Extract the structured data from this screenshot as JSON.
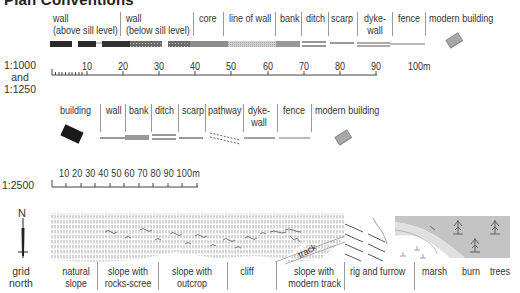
{
  "title": "Plan Conventions",
  "section1": {
    "labels": [
      {
        "id": "wall-above",
        "line1": "wall",
        "line2": "(above sill level)"
      },
      {
        "id": "wall-below",
        "line1": "wall",
        "line2": "(below sill level)"
      },
      {
        "id": "core",
        "line1": "core",
        "line2": ""
      },
      {
        "id": "line-of-wall",
        "line1": "line of wall",
        "line2": ""
      },
      {
        "id": "bank",
        "line1": "bank",
        "line2": ""
      },
      {
        "id": "ditch",
        "line1": "ditch",
        "line2": ""
      },
      {
        "id": "scarp",
        "line1": "scarp",
        "line2": ""
      },
      {
        "id": "dyke-wall",
        "line1": "dyke-",
        "line2": "wall"
      },
      {
        "id": "fence",
        "line1": "fence",
        "line2": ""
      },
      {
        "id": "modern-building",
        "line1": "modern building",
        "line2": ""
      }
    ]
  },
  "scale1": {
    "label_line1": "1:1000",
    "label_line2": "and",
    "label_line3": "1:1250",
    "ticks": [
      "10",
      "20",
      "30",
      "40",
      "50",
      "60",
      "70",
      "80",
      "90",
      "100m"
    ]
  },
  "section2": {
    "labels": [
      {
        "id": "building",
        "line1": "building",
        "line2": ""
      },
      {
        "id": "wall",
        "line1": "wall",
        "line2": ""
      },
      {
        "id": "bank",
        "line1": "bank",
        "line2": ""
      },
      {
        "id": "ditch",
        "line1": "ditch",
        "line2": ""
      },
      {
        "id": "scarp",
        "line1": "scarp",
        "line2": ""
      },
      {
        "id": "pathway",
        "line1": "pathway",
        "line2": ""
      },
      {
        "id": "dyke-wall",
        "line1": "dyke-",
        "line2": "wall"
      },
      {
        "id": "fence",
        "line1": "fence",
        "line2": ""
      },
      {
        "id": "modern-building",
        "line1": "modern building",
        "line2": ""
      }
    ]
  },
  "scale2": {
    "label": "1:2500",
    "ticks": "10 20 30 40 50 60 70 80 90 100m"
  },
  "north": {
    "letter": "N",
    "line1": "grid",
    "line2": "north"
  },
  "terrain": {
    "track_label": "track",
    "labels": [
      {
        "id": "natural-slope",
        "line1": "natural",
        "line2": "slope"
      },
      {
        "id": "slope-rocks-scree",
        "line1": "slope with",
        "line2": "rocks-scree"
      },
      {
        "id": "slope-outcrop",
        "line1": "slope with",
        "line2": "outcrop"
      },
      {
        "id": "cliff",
        "line1": "cliff",
        "line2": ""
      },
      {
        "id": "slope-modern-track",
        "line1": "slope with",
        "line2": "modern track"
      },
      {
        "id": "rig-furrow",
        "line1": "rig and furrow",
        "line2": ""
      },
      {
        "id": "marsh",
        "line1": "marsh",
        "line2": ""
      },
      {
        "id": "burn",
        "line1": "burn",
        "line2": ""
      },
      {
        "id": "trees",
        "line1": "trees",
        "line2": ""
      }
    ]
  },
  "colors": {
    "dark": "#222222",
    "mid": "#555555",
    "grey": "#999999",
    "light_fill": "#c8c8c8",
    "burn_bg": "#d6d6d6"
  }
}
